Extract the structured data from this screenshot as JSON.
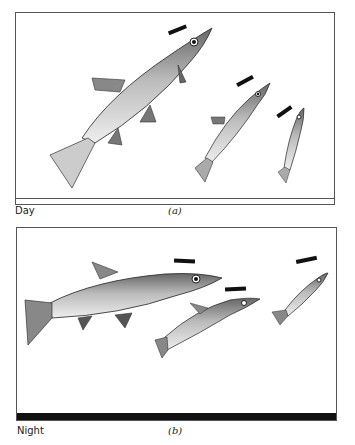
{
  "figure": {
    "panel_a": {
      "label": "Day",
      "caption": "(a)",
      "fish_count": 3,
      "description": "Three fish of decreasing size swimming upward at a steep angle, each with a short black bar above its head"
    },
    "panel_b": {
      "label": "Night",
      "caption": "(b)",
      "fish_count": 3,
      "description": "Three fish of decreasing size swimming nearly horizontally, each with a short black bar above its head; dark bar along panel bottom"
    }
  }
}
